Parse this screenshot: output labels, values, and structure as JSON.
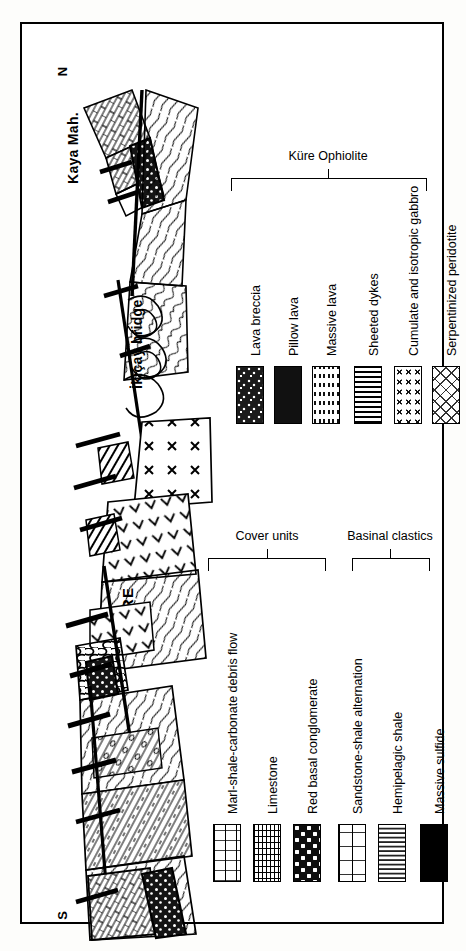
{
  "figure": {
    "type": "geological-cross-section",
    "orientation_labels": {
      "top": "N",
      "bottom": "S"
    },
    "locality_labels": [
      {
        "id": "kaya-mah",
        "text": "Kaya Mah."
      },
      {
        "id": "ikicay-bridge",
        "text": "İkiçay bridge"
      },
      {
        "id": "kure",
        "text": "KÜRE"
      }
    ]
  },
  "legend": {
    "groups": [
      {
        "id": "kure-ophiolite",
        "title": "Küre Ophiolite",
        "bracket_span_items": 6,
        "items": [
          {
            "id": "lava-breccia",
            "label": "Lava breccia",
            "pattern": "pat-breccia"
          },
          {
            "id": "pillow-lava",
            "label": "Pillow lava",
            "pattern": "pat-pillow"
          },
          {
            "id": "massive-lava",
            "label": "Massive lava",
            "pattern": "pat-massive"
          },
          {
            "id": "sheeted-dykes",
            "label": "Sheeted dykes",
            "pattern": "pat-sheeted"
          },
          {
            "id": "cumulate-isotropic-gabbro",
            "label": "Cumulate and isotropic gabbro",
            "pattern": "pat-gabbro"
          },
          {
            "id": "serpentinized-peridotite",
            "label": "Serpentinized peridotite",
            "pattern": "pat-serp"
          }
        ]
      },
      {
        "id": "cover-units",
        "title": "Cover units",
        "bracket_span_items": 3,
        "items": [
          {
            "id": "marl-shale-carbonate-debris-flow",
            "label": "Marl-shale-carbonate debris flow",
            "pattern": "pat-debris"
          },
          {
            "id": "limestone",
            "label": "Limestone",
            "pattern": "pat-limestone"
          },
          {
            "id": "red-basal-conglomerate",
            "label": "Red basal conglomerate",
            "pattern": "pat-conglom"
          }
        ]
      },
      {
        "id": "basinal-clastics",
        "title": "Basinal clastics",
        "bracket_span_items": 2,
        "items": [
          {
            "id": "sandstone-shale-alternation",
            "label": "Sandstone-shale alternation",
            "pattern": "pat-sandshale"
          },
          {
            "id": "hemipelagic-shale",
            "label": "Hemipelagic shale",
            "pattern": "pat-hemishale"
          }
        ]
      },
      {
        "id": "ore",
        "title": "",
        "bracket_span_items": 0,
        "items": [
          {
            "id": "massive-sulfide",
            "label": "Massive sulfide",
            "pattern": "pat-sulfide"
          }
        ]
      }
    ]
  },
  "colors": {
    "ink": "#000000",
    "paper": "#ffffff",
    "page_background": "#fdfdfb",
    "massive_sulfide": "#000000"
  }
}
